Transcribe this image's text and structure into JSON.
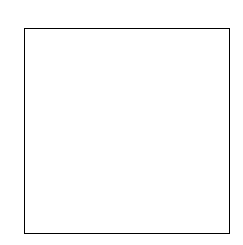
{
  "chart_data": {
    "type": "heatmap",
    "title": "",
    "xlabel": "",
    "ylabel": "",
    "colormap": "gray",
    "x_ticks": [
      "0",
      "2",
      "4",
      "6",
      "8"
    ],
    "y_ticks": [
      "0",
      "2",
      "4",
      "6",
      "8"
    ],
    "rows": 10,
    "cols": 10,
    "values": [
      [
        0.05,
        0.05,
        0.15,
        0.08,
        0.08,
        0.22,
        0.22,
        0.05,
        0.18,
        0.05
      ],
      [
        0.05,
        0.05,
        0.18,
        0.1,
        0.1,
        0.12,
        0.0,
        0.02,
        0.35,
        0.05
      ],
      [
        0.2,
        0.2,
        0.0,
        0.38,
        0.32,
        0.08,
        0.32,
        0.2,
        0.62,
        0.05
      ],
      [
        0.18,
        0.18,
        0.52,
        0.02,
        0.02,
        0.92,
        0.12,
        0.15,
        0.48,
        0.32
      ],
      [
        0.08,
        0.1,
        0.15,
        0.02,
        0.02,
        0.02,
        0.2,
        0.12,
        0.3,
        0.75
      ],
      [
        0.32,
        0.22,
        0.18,
        0.82,
        0.28,
        0.02,
        0.48,
        0.12,
        0.85,
        0.42
      ],
      [
        0.1,
        0.1,
        0.15,
        0.02,
        0.15,
        0.32,
        0.05,
        0.05,
        0.15,
        0.02
      ],
      [
        0.08,
        0.08,
        0.25,
        0.12,
        0.18,
        0.05,
        0.05,
        0.05,
        0.05,
        0.95
      ],
      [
        0.18,
        0.6,
        0.25,
        0.62,
        0.02,
        0.62,
        0.25,
        0.1,
        0.02,
        0.45
      ],
      [
        0.15,
        0.15,
        0.12,
        0.38,
        0.68,
        0.12,
        0.02,
        0.95,
        0.32,
        0.02
      ]
    ],
    "grid": false,
    "legend": "none"
  }
}
